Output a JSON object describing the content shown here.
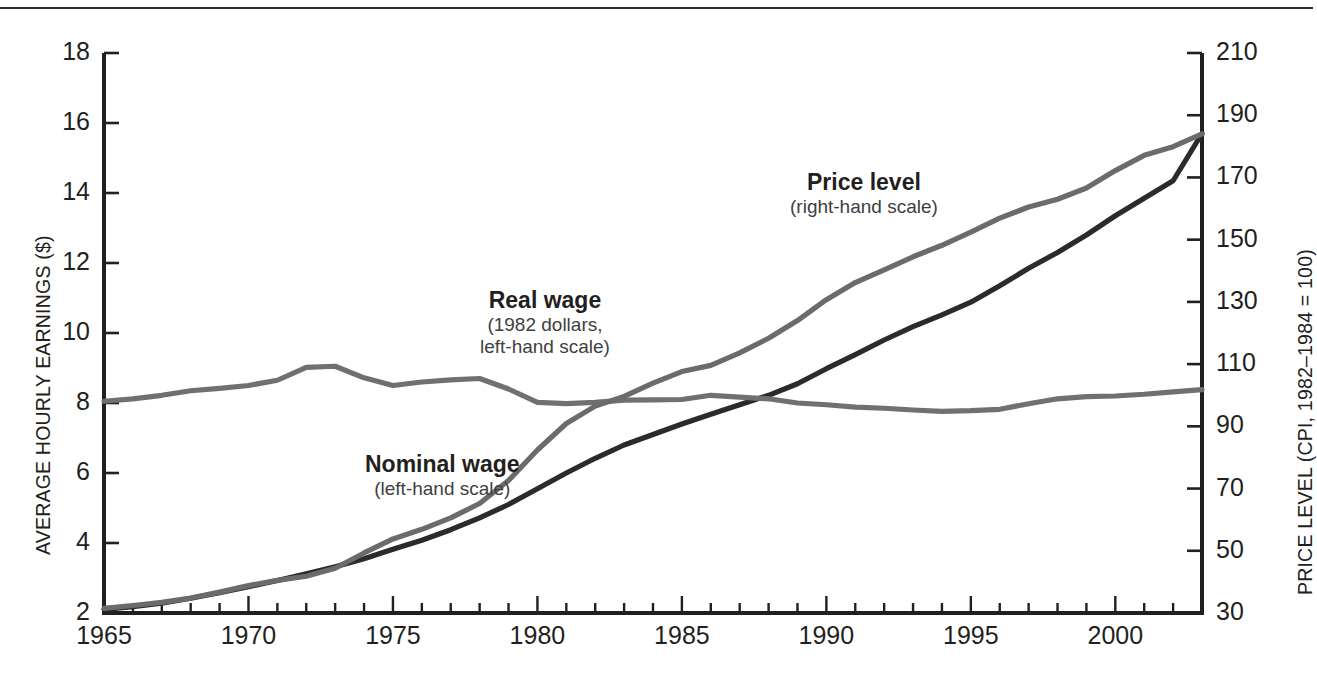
{
  "figure": {
    "top_rule": true,
    "background": "#ffffff",
    "ink": "#231f20"
  },
  "axes": {
    "left": {
      "title": "AVERAGE HOURLY EARNINGS ($)",
      "ticks": [
        "2",
        "4",
        "6",
        "8",
        "10",
        "12",
        "14",
        "16",
        "18"
      ]
    },
    "right": {
      "title": "PRICE LEVEL (CPI, 1982–1984 = 100)",
      "ticks": [
        "30",
        "50",
        "70",
        "90",
        "110",
        "130",
        "150",
        "170",
        "190",
        "210"
      ]
    },
    "bottom": {
      "ticks": [
        "1965",
        "1970",
        "1975",
        "1980",
        "1985",
        "1990",
        "1995",
        "2000"
      ]
    }
  },
  "annotations": [
    {
      "name": "price-level-annotation",
      "title": "Price level",
      "sub1": "(right-hand scale)",
      "sub2": ""
    },
    {
      "name": "real-wage-annotation",
      "title": "Real wage",
      "sub1": "(1982 dollars,",
      "sub2": "left-hand scale)"
    },
    {
      "name": "nominal-wage-annotation",
      "title": "Nominal wage",
      "sub1": "(left-hand scale)",
      "sub2": ""
    }
  ],
  "colors": {
    "nominal_wage": "#2b2b2b",
    "real_wage": "#707070",
    "price_level": "#6b6b6b",
    "axis": "#231f20"
  },
  "chart_data": {
    "type": "line",
    "title": "",
    "xlabel": "",
    "ylabel": "AVERAGE HOURLY EARNINGS ($)",
    "y2label": "PRICE LEVEL (CPI, 1982–1984 = 100)",
    "xlim": [
      1965,
      2003
    ],
    "ylim": [
      2,
      18
    ],
    "y2lim": [
      30,
      210
    ],
    "grid": false,
    "legend": "annotations-inline",
    "x": [
      1965,
      1966,
      1967,
      1968,
      1969,
      1970,
      1971,
      1972,
      1973,
      1974,
      1975,
      1976,
      1977,
      1978,
      1979,
      1980,
      1981,
      1982,
      1983,
      1984,
      1985,
      1986,
      1987,
      1988,
      1989,
      1990,
      1991,
      1992,
      1993,
      1994,
      1995,
      1996,
      1997,
      1998,
      1999,
      2000,
      2001,
      2002,
      2003
    ],
    "series": [
      {
        "name": "Nominal wage",
        "axis": "left",
        "units": "$ per hour",
        "color": "#2b2b2b",
        "values": [
          2.1,
          2.18,
          2.28,
          2.42,
          2.58,
          2.75,
          2.93,
          3.12,
          3.32,
          3.55,
          3.82,
          4.08,
          4.38,
          4.72,
          5.1,
          5.55,
          6.0,
          6.42,
          6.8,
          7.1,
          7.4,
          7.68,
          7.95,
          8.22,
          8.55,
          8.98,
          9.38,
          9.8,
          10.18,
          10.52,
          10.88,
          11.35,
          11.85,
          12.3,
          12.8,
          13.35,
          13.85,
          14.35,
          15.7
        ]
      },
      {
        "name": "Real wage",
        "axis": "left",
        "units": "1982 dollars per hour",
        "color": "#707070",
        "values": [
          8.05,
          8.12,
          8.22,
          8.35,
          8.42,
          8.5,
          8.65,
          9.02,
          9.05,
          8.72,
          8.5,
          8.6,
          8.66,
          8.7,
          8.4,
          8.02,
          7.98,
          8.02,
          8.08,
          8.09,
          8.1,
          8.22,
          8.17,
          8.12,
          8.0,
          7.95,
          7.88,
          7.85,
          7.8,
          7.76,
          7.78,
          7.82,
          7.98,
          8.12,
          8.18,
          8.2,
          8.25,
          8.32,
          8.38
        ]
      },
      {
        "name": "Price level",
        "axis": "right",
        "units": "CPI (1982-1984 = 100)",
        "color": "#6b6b6b",
        "values": [
          31.5,
          32.4,
          33.4,
          34.8,
          36.7,
          38.8,
          40.5,
          41.8,
          44.4,
          49.3,
          53.8,
          56.9,
          60.6,
          65.2,
          72.6,
          82.4,
          90.9,
          96.5,
          99.6,
          103.9,
          107.6,
          109.6,
          113.6,
          118.3,
          124.0,
          130.7,
          136.2,
          140.3,
          144.5,
          148.2,
          152.4,
          156.9,
          160.5,
          163.0,
          166.6,
          172.2,
          177.1,
          179.9,
          184.0
        ]
      }
    ]
  }
}
